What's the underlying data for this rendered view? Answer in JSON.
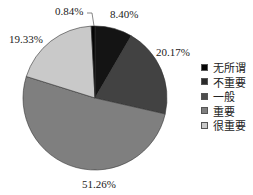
{
  "chart_data": {
    "type": "pie",
    "title": "",
    "categories": [
      "无所谓",
      "不重要",
      "一般",
      "重要",
      "很重要"
    ],
    "values": [
      0.84,
      8.4,
      20.17,
      51.26,
      19.33
    ],
    "slices_clockwise_from_top": [
      {
        "name": "不重要",
        "value": 8.4,
        "label": "8.40%",
        "color": "#141414"
      },
      {
        "name": "一般",
        "value": 20.17,
        "label": "20.17%",
        "color": "#424242"
      },
      {
        "name": "重要",
        "value": 51.26,
        "label": "51.26%",
        "color": "#7f7f7f"
      },
      {
        "name": "很重要",
        "value": 19.33,
        "label": "19.33%",
        "color": "#c9c9c9"
      },
      {
        "name": "无所谓",
        "value": 0.84,
        "label": "0.84%",
        "color": "#050505"
      }
    ],
    "legend": {
      "position": "right",
      "entries": [
        {
          "label": "无所谓",
          "color": "#050505"
        },
        {
          "label": "不重要",
          "color": "#2a2a2a"
        },
        {
          "label": "一般",
          "color": "#4d4d4d"
        },
        {
          "label": "重要",
          "color": "#7f7f7f"
        },
        {
          "label": "很重要",
          "color": "#c9c9c9"
        }
      ]
    }
  },
  "labels": {
    "l084": "0.84%",
    "l840": "8.40%",
    "l2017": "20.17%",
    "l5126": "51.26%",
    "l1933": "19.33%"
  }
}
